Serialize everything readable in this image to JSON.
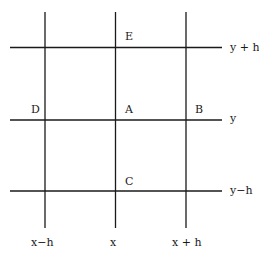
{
  "diagram": {
    "type": "finite-difference-grid",
    "colors": {
      "line": "#1a1a1a",
      "background": "#ffffff"
    },
    "points": {
      "E": "E",
      "D": "D",
      "A": "A",
      "B": "B",
      "C": "C"
    },
    "row_labels": {
      "top": "y + h",
      "middle": "y",
      "bottom": "y−h"
    },
    "column_labels": {
      "left": "x−h",
      "middle": "x",
      "right": "x + h"
    }
  }
}
